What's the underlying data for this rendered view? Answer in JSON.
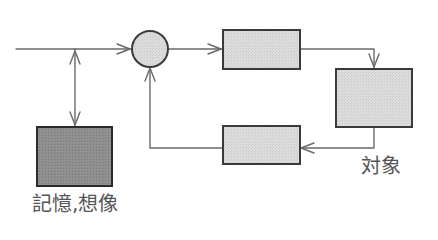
{
  "diagram": {
    "type": "block-diagram",
    "labels": {
      "object": "対象",
      "memory": "記憶,想像"
    },
    "colors": {
      "line": "#6a6a6a",
      "block_border": "#3a3a3a",
      "block_fill": "#d8d8d8",
      "memory_fill": "#8c8c8c",
      "summing_fill": "#dedede",
      "text": "#555555"
    },
    "nodes": [
      {
        "id": "summing-junction",
        "shape": "circle"
      },
      {
        "id": "forward-block",
        "shape": "rect"
      },
      {
        "id": "object-block",
        "shape": "rect",
        "label": "対象"
      },
      {
        "id": "feedback-block",
        "shape": "rect"
      },
      {
        "id": "memory-block",
        "shape": "rect",
        "label": "記憶,想像"
      }
    ],
    "edges": [
      {
        "from": "input",
        "to": "summing-junction"
      },
      {
        "from": "input-junction",
        "to": "memory-block",
        "bidirectional": true
      },
      {
        "from": "summing-junction",
        "to": "forward-block"
      },
      {
        "from": "forward-block",
        "to": "object-block"
      },
      {
        "from": "object-block",
        "to": "feedback-block"
      },
      {
        "from": "feedback-block",
        "to": "summing-junction"
      }
    ]
  }
}
